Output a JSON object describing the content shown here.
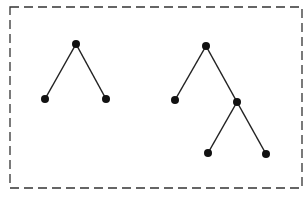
{
  "diagram": {
    "type": "trees",
    "border": {
      "x": 10,
      "y": 7,
      "width": 292,
      "height": 181,
      "style": "dashed",
      "color": "#333333"
    },
    "node_color": "#111111",
    "edge_color": "#222222",
    "trees": [
      {
        "name": "tree-1",
        "nodes": [
          {
            "id": "a",
            "x": 76,
            "y": 44
          },
          {
            "id": "b",
            "x": 45,
            "y": 99
          },
          {
            "id": "c",
            "x": 106,
            "y": 99
          }
        ],
        "edges": [
          [
            "a",
            "b"
          ],
          [
            "a",
            "c"
          ]
        ]
      },
      {
        "name": "tree-2",
        "nodes": [
          {
            "id": "a",
            "x": 206,
            "y": 46
          },
          {
            "id": "b",
            "x": 175,
            "y": 100
          },
          {
            "id": "c",
            "x": 237,
            "y": 102
          },
          {
            "id": "d",
            "x": 208,
            "y": 153
          },
          {
            "id": "e",
            "x": 266,
            "y": 154
          }
        ],
        "edges": [
          [
            "a",
            "b"
          ],
          [
            "a",
            "c"
          ],
          [
            "c",
            "d"
          ],
          [
            "c",
            "e"
          ]
        ]
      }
    ]
  }
}
